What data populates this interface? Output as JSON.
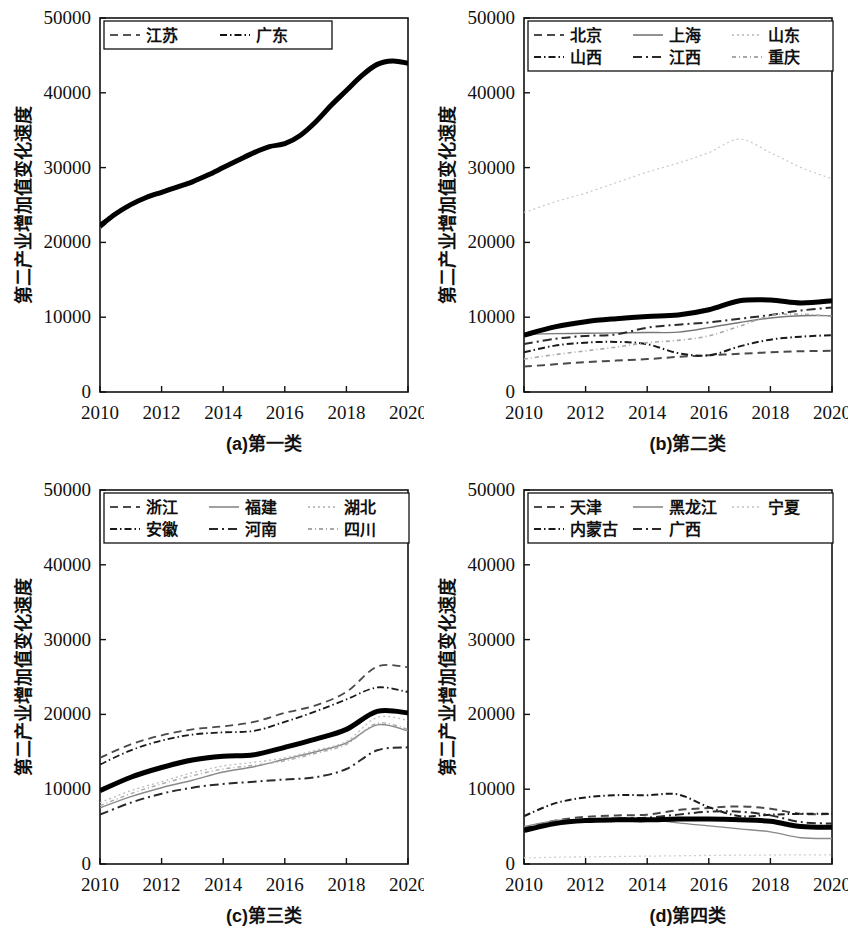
{
  "figure": {
    "width": 849,
    "height": 944,
    "background": "#ffffff",
    "ink": "#111111"
  },
  "axes": {
    "x_ticks": [
      "2010",
      "2012",
      "2014",
      "2016",
      "2018",
      "2020"
    ],
    "y_ticks": [
      "0",
      "10000",
      "20000",
      "30000",
      "40000",
      "50000"
    ],
    "y_label_a": "第二产业增加值变化速度",
    "y_label_common": "第二产业增加值变化速度",
    "xlim": [
      2010,
      2020
    ],
    "ylim": [
      0,
      50000
    ]
  },
  "captions": {
    "a": "(a)第一类",
    "b": "(b)第二类",
    "c": "(c)第三类",
    "d": "(d)第四类"
  },
  "chart_data": [
    {
      "id": "panel-a",
      "type": "line",
      "title": "(a)第一类",
      "xlabel": "",
      "ylabel": "第二产业增加值变化速度",
      "xlim": [
        2010,
        2020
      ],
      "ylim": [
        0,
        50000
      ],
      "grid": false,
      "legend_position": "top-left",
      "x": [
        2010,
        2010.5,
        2011,
        2011.5,
        2012,
        2012.5,
        2013,
        2013.5,
        2014,
        2014.5,
        2015,
        2015.5,
        2016,
        2016.5,
        2017,
        2017.5,
        2018,
        2018.5,
        2019,
        2019.5,
        2020
      ],
      "series": [
        {
          "name": "江苏",
          "style": "dashed",
          "color": "#555555",
          "width": 1.6,
          "values": [
            21800,
            23600,
            24900,
            25900,
            26600,
            27300,
            28000,
            28900,
            29900,
            30900,
            31900,
            32700,
            33100,
            34200,
            36000,
            38200,
            40200,
            42200,
            43700,
            44200,
            43900
          ]
        },
        {
          "name": "广东",
          "style": "dashdot-dense",
          "color": "#111111",
          "width": 1.6,
          "values": [
            22500,
            24000,
            25200,
            26100,
            26800,
            27500,
            28200,
            29100,
            30100,
            31100,
            32100,
            32900,
            33300,
            34400,
            36200,
            38400,
            40400,
            42400,
            43900,
            44300,
            44000
          ]
        },
        {
          "name": "类中心",
          "style": "solid-thick",
          "color": "#000000",
          "width": 5,
          "values": [
            22200,
            23800,
            25050,
            26000,
            26700,
            27400,
            28100,
            29000,
            30000,
            31000,
            32000,
            32800,
            33200,
            34300,
            36100,
            38300,
            40300,
            42300,
            43800,
            44250,
            43950
          ]
        }
      ]
    },
    {
      "id": "panel-b",
      "type": "line",
      "title": "(b)第二类",
      "xlabel": "",
      "ylabel": "第二产业增加值变化速度",
      "xlim": [
        2010,
        2020
      ],
      "ylim": [
        0,
        50000
      ],
      "grid": false,
      "legend_position": "top",
      "x": [
        2010,
        2011,
        2012,
        2013,
        2014,
        2015,
        2016,
        2017,
        2018,
        2019,
        2020
      ],
      "series": [
        {
          "name": "北京",
          "style": "dashed",
          "color": "#4a4a4a",
          "width": 2.0,
          "values": [
            3400,
            3700,
            4000,
            4200,
            4400,
            4700,
            4900,
            5100,
            5300,
            5450,
            5500
          ]
        },
        {
          "name": "上海",
          "style": "solid",
          "color": "#777777",
          "width": 1.4,
          "values": [
            7700,
            7800,
            7850,
            7900,
            7950,
            8000,
            8600,
            9300,
            9900,
            10200,
            10200
          ]
        },
        {
          "name": "山东",
          "style": "dotted-faint",
          "color": "#c8c8c8",
          "width": 1.2,
          "values": [
            24000,
            25400,
            26600,
            28000,
            29400,
            30600,
            32000,
            33800,
            32000,
            30000,
            28500
          ]
        },
        {
          "name": "山西",
          "style": "dashdot-dense",
          "color": "#1a1a1a",
          "width": 2.0,
          "values": [
            5300,
            6200,
            6600,
            6700,
            6400,
            5200,
            4900,
            6100,
            7000,
            7400,
            7600
          ]
        },
        {
          "name": "江西",
          "style": "dashdot",
          "color": "#2a2a2a",
          "width": 2.0,
          "values": [
            6400,
            7100,
            7500,
            7700,
            8600,
            9000,
            9300,
            9800,
            10300,
            10900,
            11300
          ]
        },
        {
          "name": "重庆",
          "style": "dotted-light",
          "color": "#a8a8a8",
          "width": 1.6,
          "values": [
            4400,
            5000,
            5500,
            6000,
            6600,
            6900,
            7500,
            8800,
            10200,
            10400,
            10100
          ]
        },
        {
          "name": "类中心",
          "style": "solid-thick",
          "color": "#000000",
          "width": 5,
          "values": [
            7600,
            8700,
            9400,
            9800,
            10100,
            10300,
            11000,
            12200,
            12300,
            11900,
            12200
          ]
        }
      ]
    },
    {
      "id": "panel-c",
      "type": "line",
      "title": "(c)第三类",
      "xlabel": "",
      "ylabel": "第二产业增加值变化速度",
      "xlim": [
        2010,
        2020
      ],
      "ylim": [
        0,
        50000
      ],
      "grid": false,
      "legend_position": "top",
      "x": [
        2010,
        2011,
        2012,
        2013,
        2014,
        2015,
        2016,
        2017,
        2018,
        2019,
        2020
      ],
      "series": [
        {
          "name": "浙江",
          "style": "dashed",
          "color": "#4a4a4a",
          "width": 1.8,
          "values": [
            14200,
            16000,
            17200,
            18000,
            18400,
            19000,
            20200,
            21200,
            23000,
            26400,
            26300
          ]
        },
        {
          "name": "福建",
          "style": "solid",
          "color": "#8a8a8a",
          "width": 1.4,
          "values": [
            7500,
            9000,
            10200,
            11200,
            12300,
            13000,
            14000,
            15000,
            16200,
            18600,
            17800
          ]
        },
        {
          "name": "湖北",
          "style": "dotted-faint",
          "color": "#bfbfbf",
          "width": 1.4,
          "values": [
            8200,
            9800,
            11000,
            12200,
            13100,
            13600,
            14200,
            15200,
            16400,
            19600,
            19200
          ]
        },
        {
          "name": "安徽",
          "style": "dashdot-dense",
          "color": "#1a1a1a",
          "width": 1.8,
          "values": [
            13300,
            15200,
            16500,
            17300,
            17600,
            17800,
            19000,
            20400,
            22000,
            23600,
            23000
          ]
        },
        {
          "name": "河南",
          "style": "dashdot",
          "color": "#2a2a2a",
          "width": 2.0,
          "values": [
            6600,
            8200,
            9400,
            10200,
            10700,
            11000,
            11300,
            11600,
            12700,
            15200,
            15600
          ]
        },
        {
          "name": "四川",
          "style": "dotted-light",
          "color": "#a8a8a8",
          "width": 1.4,
          "values": [
            7800,
            9400,
            10700,
            11800,
            12700,
            13200,
            13800,
            14800,
            16000,
            18800,
            18000
          ]
        },
        {
          "name": "类中心",
          "style": "solid-thick",
          "color": "#000000",
          "width": 5,
          "values": [
            9800,
            11600,
            12900,
            13900,
            14400,
            14600,
            15600,
            16700,
            18000,
            20400,
            20200
          ]
        }
      ]
    },
    {
      "id": "panel-d",
      "type": "line",
      "title": "(d)第四类",
      "xlabel": "",
      "ylabel": "第二产业增加值变化速度",
      "xlim": [
        2010,
        2020
      ],
      "ylim": [
        0,
        50000
      ],
      "grid": false,
      "legend_position": "top",
      "x": [
        2010,
        2011,
        2012,
        2013,
        2014,
        2015,
        2016,
        2017,
        2018,
        2019,
        2020
      ],
      "series": [
        {
          "name": "天津",
          "style": "dashed",
          "color": "#4a4a4a",
          "width": 2.0,
          "values": [
            4800,
            5800,
            6300,
            6500,
            6600,
            7200,
            7500,
            7700,
            7400,
            6700,
            6700
          ]
        },
        {
          "name": "黑龙江",
          "style": "solid",
          "color": "#8a8a8a",
          "width": 1.4,
          "values": [
            5000,
            5800,
            6000,
            6100,
            6000,
            5500,
            5100,
            4700,
            4300,
            3500,
            3400
          ]
        },
        {
          "name": "宁夏",
          "style": "dotted-faint",
          "color": "#d0d0d0",
          "width": 1.3,
          "values": [
            800,
            900,
            950,
            1000,
            1050,
            1100,
            1150,
            1180,
            1200,
            1220,
            1230
          ]
        },
        {
          "name": "内蒙古",
          "style": "dashdot-dense",
          "color": "#1a1a1a",
          "width": 2.0,
          "values": [
            6400,
            8100,
            8900,
            9200,
            9200,
            9300,
            7600,
            6400,
            6600,
            6700,
            6700
          ]
        },
        {
          "name": "广西",
          "style": "dashdot",
          "color": "#2a2a2a",
          "width": 2.0,
          "values": [
            4600,
            5500,
            5900,
            6100,
            6200,
            6600,
            7000,
            7000,
            6500,
            5600,
            5400
          ]
        },
        {
          "name": "类中心",
          "style": "solid-thick",
          "color": "#000000",
          "width": 5,
          "values": [
            4500,
            5400,
            5800,
            5900,
            5900,
            6000,
            6000,
            5900,
            5700,
            5000,
            4900
          ]
        }
      ]
    }
  ],
  "legends": {
    "a": {
      "rows": [
        [
          {
            "label": "江苏",
            "style": "dashed",
            "color": "#555555"
          },
          {
            "label": "广东",
            "style": "dashdot-dense",
            "color": "#111111"
          }
        ]
      ]
    },
    "b": {
      "rows": [
        [
          {
            "label": "北京",
            "style": "dashed",
            "color": "#4a4a4a"
          },
          {
            "label": "上海",
            "style": "solid",
            "color": "#777777"
          },
          {
            "label": "山东",
            "style": "dotted-faint",
            "color": "#c8c8c8"
          }
        ],
        [
          {
            "label": "山西",
            "style": "dashdot-dense",
            "color": "#1a1a1a"
          },
          {
            "label": "江西",
            "style": "dashdot",
            "color": "#2a2a2a"
          },
          {
            "label": "重庆",
            "style": "dotted-light",
            "color": "#a8a8a8"
          }
        ]
      ]
    },
    "c": {
      "rows": [
        [
          {
            "label": "浙江",
            "style": "dashed",
            "color": "#4a4a4a"
          },
          {
            "label": "福建",
            "style": "solid",
            "color": "#8a8a8a"
          },
          {
            "label": "湖北",
            "style": "dotted-faint",
            "color": "#bfbfbf"
          }
        ],
        [
          {
            "label": "安徽",
            "style": "dashdot-dense",
            "color": "#1a1a1a"
          },
          {
            "label": "河南",
            "style": "dashdot",
            "color": "#2a2a2a"
          },
          {
            "label": "四川",
            "style": "dotted-light",
            "color": "#a8a8a8"
          }
        ]
      ]
    },
    "d": {
      "rows": [
        [
          {
            "label": "天津",
            "style": "dashed",
            "color": "#4a4a4a"
          },
          {
            "label": "黑龙江",
            "style": "solid",
            "color": "#8a8a8a"
          },
          {
            "label": "宁夏",
            "style": "dotted-faint",
            "color": "#d0d0d0"
          }
        ],
        [
          {
            "label": "内蒙古",
            "style": "dashdot-dense",
            "color": "#1a1a1a"
          },
          {
            "label": "广西",
            "style": "dashdot",
            "color": "#2a2a2a"
          }
        ]
      ]
    }
  }
}
